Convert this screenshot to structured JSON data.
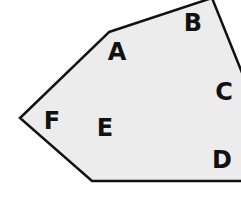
{
  "diagram": {
    "type": "polygon-regions",
    "fill_color": "#ececec",
    "stroke_color": "#111111",
    "polygon_points": [
      [
        109,
        32
      ],
      [
        212,
        -2
      ],
      [
        245,
        80
      ],
      [
        245,
        181
      ],
      [
        92,
        181
      ],
      [
        20,
        118
      ]
    ],
    "labels": [
      {
        "id": "A",
        "text": "A",
        "x": 117,
        "y": 52
      },
      {
        "id": "B",
        "text": "B",
        "x": 193,
        "y": 23
      },
      {
        "id": "C",
        "text": "C",
        "x": 224,
        "y": 92
      },
      {
        "id": "D",
        "text": "D",
        "x": 222,
        "y": 160
      },
      {
        "id": "E",
        "text": "E",
        "x": 105,
        "y": 128
      },
      {
        "id": "F",
        "text": "F",
        "x": 52,
        "y": 121
      }
    ]
  }
}
